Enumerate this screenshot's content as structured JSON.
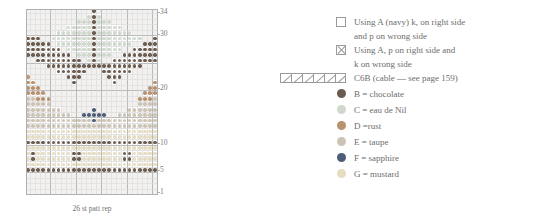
{
  "chart_data": {
    "type": "heatmap",
    "xlabel": "26 st patt rep",
    "ylabel": "",
    "grid": true,
    "columns": 26,
    "rows": 34,
    "row_tick_labels": [
      "34",
      "30",
      "20",
      "10",
      "5",
      "1"
    ],
    "row_tick_values": [
      34,
      30,
      20,
      10,
      5,
      1
    ],
    "repeat_label": "26 st patt rep",
    "legend_position": "right",
    "color_key": {
      "A": "#f2f1ef",
      "B": "#6b5a4e",
      "C": "#cfd8cd",
      "D": "#b8916f",
      "E": "#cdc3b4",
      "F": "#4e5d77",
      "G": "#e6dcc0"
    },
    "palette_order": [
      "A",
      "B",
      "C",
      "D",
      "E",
      "F",
      "G"
    ],
    "rows_data": [
      "AAAAAAAAAAAAABAAAAAAAAAAAA",
      "AAAAAAAAAAAACBCAAAAAAAAAAA",
      "AAAAAAAAAACCCBCCCAAAAAAAAA",
      "AAAAAAAACCCCCBCCCCCAAAAAAA",
      "AAAAAACCCCCCCBCCCCCCCAAAAA",
      "BBBAACCCCCCCCBCCCCCCCCCAABB",
      "BBBBBACCCCCCCBCCCCCCCAABBBB",
      "BBBBBBBACCCCCBCCCCCAABBBBBB",
      "BBBBBBBBBACCCBCCCAABBBBBBBB",
      "AABBBBBBBBBACBCAABBBBBBBBBA",
      "AAAABBBBBBBBBBBBBBBBBBBAAAA",
      "AAAAAABBBBBBAAABBBBBBAAAAAA",
      "DAAAAAAABBBAAAAABBBAAAAAAAD",
      "DDAAAAAAABAAAAAAABAAAAAAADD",
      "DDDAAAAAAAAAAAAAAAAAAAAADDD",
      "DDDDAAAAAAAAAAAAAAAAAAADDDD",
      "EEDDDAAAAAAAAAAAAAAAAADDDEE",
      "EEEEEAAAAAAAAAAAAAAAAAEEEEE",
      "EEEEEEEAAAAAAFAAAAAAEEEEEEE",
      "EEEEEEEEEAAFFFFFAAEEEEEEEEE",
      "EEEEEEEEEEEEEFEEEEEEEEEEEEE",
      "EEEEEEEEEEEEEEEEEEEEEEEEEEE",
      "GGGGGGGGGGGGGGGGGGGGGGGGGGG",
      "GGGGGGGGGGGGGGGGGGGGGGGGGGG",
      "BBBBBBBBBBBBBBBBBBBBBBBBBBB",
      "GGGGGGGGGGGGGGGGGGGGGGGGGGG",
      "GBGGGGGGGBBGGGGGGGGBBGGGGGG",
      "GBGGGGGGGBBGGGGGGGGBBGGGGGG",
      "GGGGGGGGGGGGGGGGGGGGGGGGGGG",
      "BBBBBBBBBBBBBBBBBBBBBBBBBBB",
      "AAAAAAAAAAAAAAAAAAAAAAAAAAA",
      "AAAAAAAAAAAAAAAAAAAAAAAAAAA",
      "AAAAAAAAAAAAAAAAAAAAAAAAAAA",
      "AAAAAAAAAAAAAAAAAAAAAAAAAAA"
    ]
  },
  "legend": {
    "items": [
      {
        "swatch": "empty-box",
        "line1": "Using A (navy) k, on right side",
        "line2": "and p on wrong side",
        "color": "#ffffff"
      },
      {
        "swatch": "x-box",
        "line1": "Using A, p on right side and",
        "line2": "k on wrong side",
        "color": "#ffffff"
      },
      {
        "swatch": "cable-cells",
        "line1": "C6B (cable — see page 159)",
        "line2": "",
        "color": "#ffffff"
      },
      {
        "swatch": "dot",
        "line1": "B = chocolate",
        "line2": "",
        "color": "#6b5a4e"
      },
      {
        "swatch": "dot",
        "line1": "C = eau de Nil",
        "line2": "",
        "color": "#cfd8cd"
      },
      {
        "swatch": "dot",
        "line1": "D =rust",
        "line2": "",
        "color": "#b8916f"
      },
      {
        "swatch": "dot",
        "line1": "E = taupe",
        "line2": "",
        "color": "#cdc3b4"
      },
      {
        "swatch": "dot",
        "line1": "F = sapphire",
        "line2": "",
        "color": "#4e5d77"
      },
      {
        "swatch": "dot",
        "line1": "G = mustard",
        "line2": "",
        "color": "#e6dcc0"
      }
    ]
  }
}
